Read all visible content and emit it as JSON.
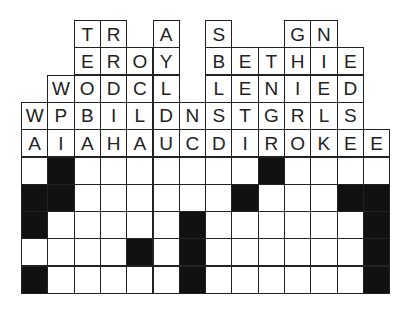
{
  "puzzle": {
    "type": "quote-falls",
    "columns": 14,
    "colors": {
      "line": "#222222",
      "black": "#111111",
      "white": "#ffffff",
      "text": "#222222"
    },
    "letter_rows": [
      [
        null,
        null,
        "T",
        "R",
        null,
        "A",
        null,
        "S",
        null,
        null,
        "G",
        "N",
        null,
        null
      ],
      [
        null,
        null,
        "E",
        "R",
        "O",
        "Y",
        null,
        "B",
        "E",
        "T",
        "H",
        "I",
        "E",
        null
      ],
      [
        null,
        "W",
        "O",
        "D",
        "C",
        "L",
        null,
        "L",
        "E",
        "N",
        "I",
        "E",
        "D",
        null
      ],
      [
        "W",
        "P",
        "B",
        "I",
        "L",
        "D",
        "N",
        "S",
        "T",
        "G",
        "R",
        "L",
        "S",
        null
      ],
      [
        "A",
        "I",
        "A",
        "H",
        "A",
        "U",
        "C",
        "D",
        "I",
        "R",
        "O",
        "K",
        "E",
        "E"
      ]
    ],
    "grid_rows": [
      [
        0,
        1,
        0,
        0,
        0,
        0,
        0,
        0,
        0,
        1,
        0,
        0,
        0,
        0
      ],
      [
        1,
        1,
        0,
        0,
        0,
        0,
        0,
        0,
        1,
        0,
        0,
        0,
        1,
        1
      ],
      [
        1,
        0,
        0,
        0,
        0,
        0,
        1,
        0,
        0,
        0,
        0,
        0,
        0,
        1
      ],
      [
        0,
        0,
        0,
        0,
        1,
        0,
        1,
        0,
        0,
        0,
        0,
        0,
        0,
        1
      ],
      [
        1,
        0,
        0,
        0,
        0,
        0,
        1,
        0,
        0,
        0,
        0,
        0,
        0,
        1
      ]
    ]
  }
}
